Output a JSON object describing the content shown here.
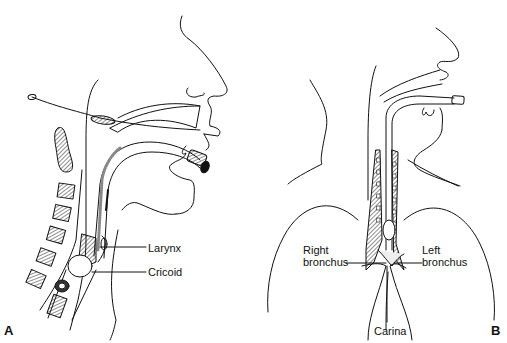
{
  "figure": {
    "panels": [
      {
        "id": "A",
        "label": "A",
        "description": "Sagittal view of head and neck with orotracheal tube in place",
        "annotations": {
          "larynx": "Larynx",
          "cricoid": "Cricoid"
        }
      },
      {
        "id": "B",
        "label": "B",
        "description": "Frontal view of airway showing tube position above carina",
        "annotations": {
          "right_bronchus_line1": "Right",
          "right_bronchus_line2": "bronchus",
          "left_bronchus_line1": "Left",
          "left_bronchus_line2": "bronchus",
          "carina": "Carina"
        }
      }
    ]
  }
}
